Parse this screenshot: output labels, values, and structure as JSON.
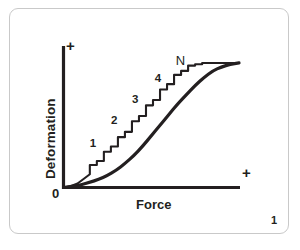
{
  "figure": {
    "number": "1",
    "frame_color": "#c9c9c9",
    "background_color": "#ffffff",
    "ink_color": "#231f20"
  },
  "chart_data": {
    "type": "line",
    "title": "",
    "xlabel": "Force",
    "ylabel": "Deformation",
    "x_axis_end_marker": "+",
    "y_axis_end_marker": "+",
    "origin_label": "0",
    "grid": false,
    "legend": "none",
    "xlim": [
      0,
      100
    ],
    "ylim": [
      0,
      100
    ],
    "tick_labels": {
      "x": [],
      "y": []
    },
    "annotations": [
      {
        "text": "1",
        "x": 19,
        "y": 27
      },
      {
        "text": "2",
        "x": 31,
        "y": 44
      },
      {
        "text": "3",
        "x": 43,
        "y": 60
      },
      {
        "text": "4",
        "x": 56,
        "y": 76
      },
      {
        "text": "N",
        "x": 68,
        "y": 90
      }
    ],
    "series": [
      {
        "name": "smooth-response-curve",
        "style": "smooth-sigmoid",
        "x": [
          0,
          5,
          10,
          15,
          20,
          25,
          30,
          35,
          40,
          45,
          50,
          55,
          60,
          65,
          70,
          75,
          80,
          85,
          90,
          95,
          100
        ],
        "y": [
          0,
          1,
          2,
          4,
          6,
          9,
          13,
          18,
          24,
          31,
          39,
          47,
          55,
          63,
          70,
          77,
          83,
          88,
          91,
          93,
          94
        ]
      },
      {
        "name": "stepwise-ratchet-curve",
        "style": "staircase",
        "x": [
          0,
          4,
          8,
          12,
          15,
          15,
          19,
          19,
          23,
          23,
          27,
          27,
          31,
          31,
          35,
          35,
          39,
          39,
          43,
          43,
          47,
          47,
          51,
          51,
          55,
          55,
          59,
          59,
          63,
          63,
          67,
          67,
          71,
          71,
          75,
          75,
          79,
          79,
          84,
          90,
          96,
          100
        ],
        "y": [
          0,
          1,
          3,
          7,
          10,
          17,
          17,
          20,
          20,
          27,
          27,
          31,
          31,
          38,
          38,
          42,
          42,
          50,
          50,
          54,
          54,
          62,
          62,
          66,
          66,
          74,
          74,
          78,
          78,
          85,
          85,
          88,
          88,
          92,
          92,
          93,
          93,
          94,
          94,
          94,
          94,
          94
        ]
      }
    ]
  }
}
